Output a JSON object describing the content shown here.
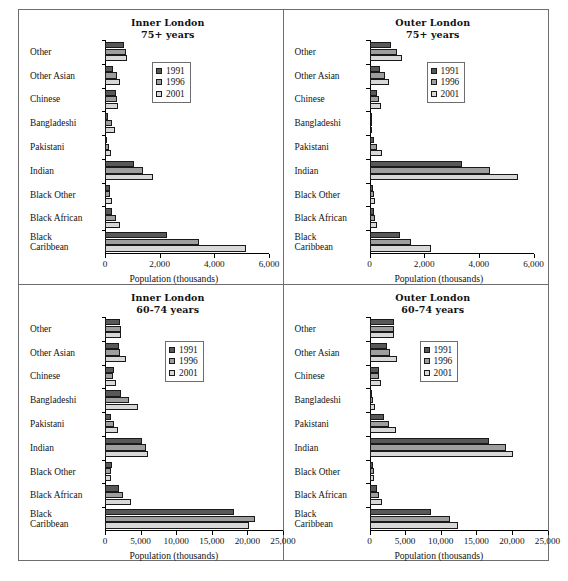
{
  "cutoff_text": "",
  "categories": [
    "Other",
    "Other Asian",
    "Chinese",
    "Bangladeshi",
    "Pakistani",
    "Indian",
    "Black Other",
    "Black African",
    "Black\nCaribbean"
  ],
  "series_names": [
    "1991",
    "1996",
    "2001"
  ],
  "series_colors": [
    "#585858",
    "#9e9e9e",
    "#d8d8d8"
  ],
  "axis_title": "Population (thousands)",
  "panels": [
    {
      "id": "inner-london-75plus",
      "title_line1": "Inner London",
      "title_line2": "75+ years"
    },
    {
      "id": "outer-london-75plus",
      "title_line1": "Outer London",
      "title_line2": "75+ years"
    },
    {
      "id": "inner-london-60-74",
      "title_line1": "Inner London",
      "title_line2": "60-74 years"
    },
    {
      "id": "outer-london-60-74",
      "title_line1": "Outer London",
      "title_line2": "60-74 years"
    }
  ],
  "chart_data": [
    {
      "type": "bar",
      "orientation": "horizontal",
      "title": "Inner London 75+ years",
      "xlabel": "Population (thousands)",
      "ylabel": "",
      "xlim": [
        0,
        6000
      ],
      "xticks": [
        0,
        2000,
        4000,
        6000
      ],
      "xticklabels": [
        "0",
        "2,000",
        "4,000",
        "6,000"
      ],
      "grid": false,
      "legend_position": "upper-center",
      "categories": [
        "Other",
        "Other Asian",
        "Chinese",
        "Bangladeshi",
        "Pakistani",
        "Indian",
        "Black Other",
        "Black African",
        "Black Caribbean"
      ],
      "series": [
        {
          "name": "1991",
          "values": [
            700,
            300,
            400,
            120,
            90,
            1050,
            170,
            260,
            2250
          ]
        },
        {
          "name": "1996",
          "values": [
            750,
            450,
            430,
            240,
            150,
            1400,
            200,
            390,
            3450
          ]
        },
        {
          "name": "2001",
          "values": [
            820,
            560,
            480,
            380,
            230,
            1760,
            260,
            560,
            5150
          ]
        }
      ]
    },
    {
      "type": "bar",
      "orientation": "horizontal",
      "title": "Outer London 75+ years",
      "xlabel": "Population (thousands)",
      "ylabel": "",
      "xlim": [
        0,
        6000
      ],
      "xticks": [
        0,
        2000,
        4000,
        6000
      ],
      "xticklabels": [
        "0",
        "2,000",
        "4,000",
        "6,000"
      ],
      "grid": false,
      "legend_position": "upper-center",
      "categories": [
        "Other",
        "Other Asian",
        "Chinese",
        "Bangladeshi",
        "Pakistani",
        "Indian",
        "Black Other",
        "Black African",
        "Black Caribbean"
      ],
      "series": [
        {
          "name": "1991",
          "values": [
            780,
            380,
            270,
            40,
            180,
            3400,
            130,
            170,
            1100
          ]
        },
        {
          "name": "1996",
          "values": [
            1020,
            580,
            340,
            60,
            290,
            4400,
            150,
            200,
            1500
          ]
        },
        {
          "name": "2001",
          "values": [
            1200,
            730,
            420,
            90,
            470,
            5450,
            190,
            260,
            2250
          ]
        }
      ]
    },
    {
      "type": "bar",
      "orientation": "horizontal",
      "title": "Inner London 60-74 years",
      "xlabel": "Population (thousands)",
      "ylabel": "",
      "xlim": [
        0,
        25000
      ],
      "xticks": [
        0,
        5000,
        10000,
        15000,
        20000,
        25000
      ],
      "xticklabels": [
        "0",
        "5,000",
        "10,000",
        "15,000",
        "20,000",
        "25,000"
      ],
      "grid": false,
      "legend_position": "upper-center",
      "categories": [
        "Other",
        "Other Asian",
        "Chinese",
        "Bangladeshi",
        "Pakistani",
        "Indian",
        "Black Other",
        "Black African",
        "Black Caribbean"
      ],
      "series": [
        {
          "name": "1991",
          "values": [
            2100,
            1900,
            1200,
            2300,
            900,
            5200,
            950,
            1900,
            18100
          ]
        },
        {
          "name": "1996",
          "values": [
            2200,
            2100,
            1150,
            3400,
            1250,
            5700,
            800,
            2500,
            21000
          ]
        },
        {
          "name": "2001",
          "values": [
            2300,
            2900,
            1500,
            4600,
            1800,
            6100,
            900,
            3700,
            20200
          ]
        }
      ]
    },
    {
      "type": "bar",
      "orientation": "horizontal",
      "title": "Outer London 60-74 years",
      "xlabel": "Population (thousands)",
      "ylabel": "",
      "xlim": [
        0,
        25000
      ],
      "xticks": [
        0,
        5000,
        10000,
        15000,
        20000,
        25000
      ],
      "xticklabels": [
        "0",
        "5,000",
        "10,000",
        "15,000",
        "20,000",
        "25,000"
      ],
      "grid": false,
      "legend_position": "upper-center",
      "categories": [
        "Other",
        "Other Asian",
        "Chinese",
        "Bangladeshi",
        "Pakistani",
        "Indian",
        "Black Other",
        "Black African",
        "Black Caribbean"
      ],
      "series": [
        {
          "name": "1991",
          "values": [
            3500,
            2400,
            1300,
            400,
            2100,
            16800,
            500,
            1100,
            8700
          ]
        },
        {
          "name": "1996",
          "values": [
            3400,
            2900,
            1300,
            500,
            2700,
            19200,
            600,
            1300,
            11300
          ]
        },
        {
          "name": "2001",
          "values": [
            3400,
            3900,
            1600,
            800,
            3700,
            20200,
            700,
            1700,
            12400
          ]
        }
      ]
    }
  ]
}
